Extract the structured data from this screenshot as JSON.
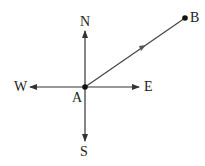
{
  "diagram": {
    "type": "compass-vector",
    "labels": {
      "north": "N",
      "south": "S",
      "east": "E",
      "west": "W",
      "origin": "A",
      "endpoint": "B"
    },
    "colors": {
      "line": "#333333",
      "background": "#ffffff"
    }
  }
}
